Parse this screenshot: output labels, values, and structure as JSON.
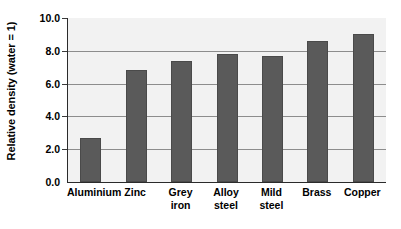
{
  "chart_data": {
    "type": "bar",
    "title": "",
    "xlabel": "",
    "ylabel": "Relative density (water = 1)",
    "categories": [
      "Aluminium",
      "Zinc",
      "Grey\niron",
      "Alloy\nsteel",
      "Mild\nsteel",
      "Brass",
      "Copper"
    ],
    "values": [
      2.7,
      6.8,
      7.4,
      7.8,
      7.7,
      8.6,
      9.0
    ],
    "ylim": [
      0.0,
      10.0
    ],
    "yticks": [
      "0.0",
      "2.0",
      "4.0",
      "6.0",
      "8.0",
      "10.0"
    ],
    "ytick_values": [
      0.0,
      2.0,
      4.0,
      6.0,
      8.0,
      10.0
    ],
    "grid": true,
    "legend": "none",
    "colors": {
      "bar": "#5a5a5a",
      "plot_background": "#f2f2f2",
      "page_background": "#ffffff",
      "axis": "#2b2b2b",
      "gridline": "#8d8d8d",
      "text": "#000000"
    }
  }
}
